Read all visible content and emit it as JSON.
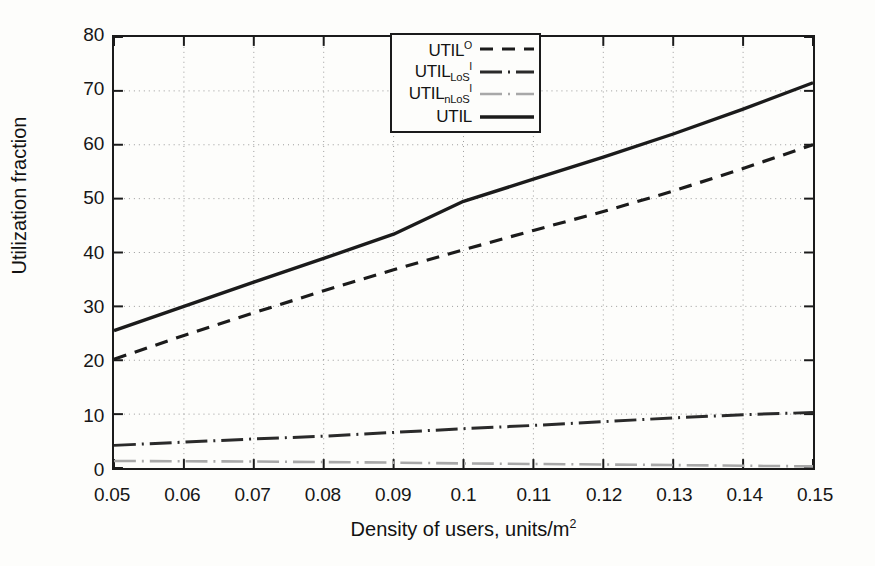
{
  "figure": {
    "background_color": "#fdfdfb",
    "axis_color": "#1b1b1b",
    "grid_color": "#9a9a9a"
  },
  "axes": {
    "ylabel": "Utilization fraction",
    "xlabel_prefix": "Density of users, units/m",
    "xlabel_exponent": "2",
    "xlabel_full": "Density of users, units/m2"
  },
  "legend": {
    "entries": [
      {
        "base": "UTIL",
        "sub": "",
        "sup": "O",
        "label": "UTIL^O",
        "style": "dashed",
        "color": "#1b1b1b",
        "width": 3.2,
        "dasharray": "13,9"
      },
      {
        "base": "UTIL",
        "sub": "LoS",
        "sup": "I",
        "label": "UTIL_LoS^I",
        "style": "dashdot",
        "color": "#2a2a2a",
        "width": 3.0,
        "dasharray": "22,6,2,6"
      },
      {
        "base": "UTIL",
        "sub": "nLoS",
        "sup": "I",
        "label": "UTIL_nLoS^I",
        "style": "dashdot",
        "color": "#a8a8a8",
        "width": 2.6,
        "dasharray": "22,6,2,6"
      },
      {
        "base": "UTIL",
        "sub": "",
        "sup": "",
        "label": "UTIL",
        "style": "solid",
        "color": "#1b1b1b",
        "width": 3.4,
        "dasharray": "none"
      }
    ]
  },
  "chart_data": {
    "type": "line",
    "title": "",
    "xlabel": "Density of users, units/m2",
    "ylabel": "Utilization fraction",
    "xlim": [
      0.05,
      0.15
    ],
    "ylim": [
      0,
      80
    ],
    "xticks": [
      0.05,
      0.06,
      0.07,
      0.08,
      0.09,
      0.1,
      0.11,
      0.12,
      0.13,
      0.14,
      0.15
    ],
    "xtick_labels": [
      "0.05",
      "0.06",
      "0.07",
      "0.08",
      "0.09",
      "0.1",
      "0.11",
      "0.12",
      "0.13",
      "0.14",
      "0.15"
    ],
    "yticks": [
      0,
      10,
      20,
      30,
      40,
      50,
      60,
      70,
      80
    ],
    "ytick_labels": [
      "0",
      "10",
      "20",
      "30",
      "40",
      "50",
      "60",
      "70",
      "80"
    ],
    "grid": true,
    "grid_style": "dotted",
    "legend_position": "upper center",
    "x": [
      0.05,
      0.06,
      0.07,
      0.08,
      0.09,
      0.1,
      0.11,
      0.12,
      0.13,
      0.14,
      0.15
    ],
    "series": [
      {
        "name": "UTIL^O",
        "style": "dashed",
        "color": "#1b1b1b",
        "width": 3.2,
        "dasharray": "13,9",
        "values": [
          20.2,
          24.6,
          28.8,
          32.9,
          36.8,
          40.5,
          44.1,
          47.6,
          51.4,
          55.6,
          60.0
        ]
      },
      {
        "name": "UTIL_LoS^I",
        "style": "dashdot",
        "color": "#2a2a2a",
        "width": 3.0,
        "dasharray": "22,6,2,6",
        "values": [
          4.2,
          4.8,
          5.4,
          5.9,
          6.6,
          7.3,
          7.9,
          8.6,
          9.3,
          9.9,
          10.3
        ]
      },
      {
        "name": "UTIL_nLoS^I",
        "style": "dashdot",
        "color": "#a8a8a8",
        "width": 2.6,
        "dasharray": "22,6,2,6",
        "values": [
          1.3,
          1.25,
          1.2,
          1.1,
          1.0,
          0.85,
          0.75,
          0.65,
          0.55,
          0.42,
          0.3
        ]
      },
      {
        "name": "UTIL",
        "style": "solid",
        "color": "#1b1b1b",
        "width": 3.4,
        "dasharray": "none",
        "values": [
          25.5,
          30.0,
          34.5,
          38.9,
          43.4,
          49.5,
          53.6,
          57.7,
          62.0,
          66.6,
          71.5
        ]
      }
    ]
  }
}
